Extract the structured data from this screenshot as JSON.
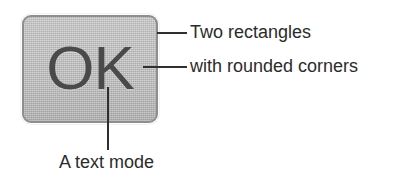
{
  "diagram": {
    "background_color": "#ffffff"
  },
  "button": {
    "label": "OK",
    "fill_color": "#bdbdbd",
    "border_color": "#8e8e8e",
    "text_color": "#4a4a4a",
    "corner_radius": "9px"
  },
  "annotations": [
    {
      "id": "annotation-two-rectangles",
      "text": "Two rectangles",
      "leader": "horizontal",
      "target": "button-outer-edge"
    },
    {
      "id": "annotation-rounded-corners",
      "text": "with rounded corners",
      "leader": "horizontal",
      "target": "button-inner-frame"
    },
    {
      "id": "annotation-text-mode",
      "text": "A text mode",
      "leader": "vertical",
      "target": "button-label"
    }
  ],
  "leader_color": "#2f2f2f",
  "caption_color": "#2b2b2b"
}
